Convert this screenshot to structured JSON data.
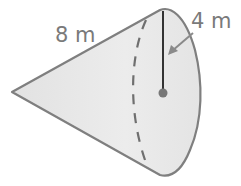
{
  "diagram": {
    "shape": "cone",
    "labels": {
      "slant_height": "8 m",
      "radius": "4 m"
    },
    "colors": {
      "fill": "#e6e6e6",
      "outline": "#7f7f7f",
      "radius_line": "#333333",
      "center_dot": "#777777",
      "label_text": "#7a7a7a"
    }
  }
}
